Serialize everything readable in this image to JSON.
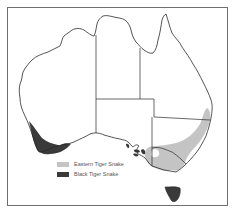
{
  "map": {
    "region": "Australia",
    "colors": {
      "eastern_tiger_snake": "#c4c4c4",
      "black_tiger_snake": "#3a3a3a",
      "outline": "#2a2a2a",
      "background": "#ffffff"
    }
  },
  "legend": {
    "items": [
      {
        "label": "Eastern Tiger Snake",
        "color": "#c4c4c4"
      },
      {
        "label": "Black Tiger Snake",
        "color": "#3a3a3a"
      }
    ]
  }
}
